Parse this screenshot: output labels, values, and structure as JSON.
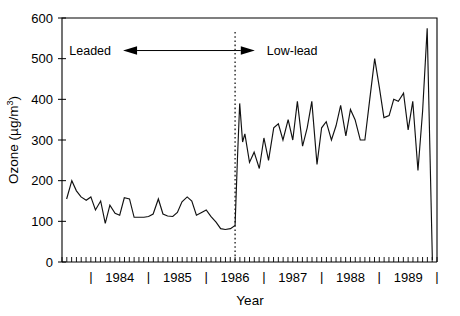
{
  "chart_data": {
    "type": "line",
    "title": "",
    "xlabel": "Year",
    "ylabel": "Ozone (µg/m",
    "ylabel_sup": "3",
    "ylabel_close": ")",
    "ylim": [
      0,
      600
    ],
    "yticks": [
      0,
      100,
      200,
      300,
      400,
      500,
      600
    ],
    "ytick_labels": [
      "0",
      "100",
      "200",
      "300",
      "400",
      "500",
      "600"
    ],
    "xlim": [
      1983.5,
      1990.0
    ],
    "xtick_labels": [
      "1984",
      "1985",
      "1986",
      "1987",
      "1988",
      "1989"
    ],
    "x_separator_label": "|",
    "x_separator_positions": [
      1984.0,
      1985.0,
      1986.0,
      1987.0,
      1988.0,
      1989.0,
      1990.0
    ],
    "x_minor_tick_step_months": 1,
    "grid": false,
    "legend": "none",
    "annotations": [
      {
        "text": "Leaded",
        "x": 1984.35,
        "y": 520,
        "arrow": "left"
      },
      {
        "text": "Low-lead",
        "x": 1987.05,
        "y": 520,
        "arrow": "right"
      }
    ],
    "divider": {
      "x": 1986.5,
      "style": "dotted",
      "label": "leaded / low-lead transition"
    },
    "series": [
      {
        "name": "Ozone monthly mean",
        "x": [
          1983.58,
          1983.67,
          1983.75,
          1983.83,
          1983.92,
          1984.0,
          1984.08,
          1984.17,
          1984.25,
          1984.33,
          1984.42,
          1984.5,
          1984.58,
          1984.67,
          1984.75,
          1984.83,
          1984.92,
          1985.0,
          1985.08,
          1985.17,
          1985.25,
          1985.33,
          1985.42,
          1985.5,
          1985.58,
          1985.67,
          1985.75,
          1985.83,
          1985.92,
          1986.0,
          1986.08,
          1986.17,
          1986.25,
          1986.33,
          1986.42,
          1986.5,
          1986.54,
          1986.58,
          1986.63,
          1986.67,
          1986.75,
          1986.83,
          1986.92,
          1987.0,
          1987.08,
          1987.17,
          1987.25,
          1987.33,
          1987.42,
          1987.5,
          1987.58,
          1987.67,
          1987.75,
          1987.83,
          1987.92,
          1988.0,
          1988.08,
          1988.17,
          1988.25,
          1988.33,
          1988.42,
          1988.5,
          1988.58,
          1988.67,
          1988.75,
          1988.83,
          1988.92,
          1989.0,
          1989.08,
          1989.17,
          1989.25,
          1989.33,
          1989.42,
          1989.5,
          1989.58,
          1989.67,
          1989.75,
          1989.83,
          1989.92
        ],
        "values": [
          155,
          200,
          175,
          160,
          152,
          160,
          128,
          150,
          95,
          140,
          120,
          115,
          158,
          155,
          110,
          110,
          110,
          112,
          118,
          155,
          118,
          113,
          112,
          122,
          148,
          160,
          150,
          115,
          122,
          128,
          112,
          98,
          82,
          80,
          82,
          90,
          250,
          390,
          295,
          315,
          245,
          270,
          230,
          305,
          250,
          330,
          340,
          300,
          350,
          300,
          395,
          285,
          330,
          395,
          240,
          330,
          345,
          300,
          335,
          385,
          310,
          375,
          350,
          300,
          300,
          395,
          500,
          430,
          355,
          360,
          400,
          395,
          415,
          325,
          395,
          225,
          370,
          575,
          5
        ]
      }
    ]
  }
}
